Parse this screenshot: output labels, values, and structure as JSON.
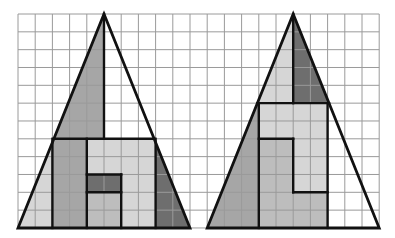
{
  "diagram": {
    "grid": {
      "origin_px": [
        18,
        14
      ],
      "cell_w_px": 17.2,
      "cell_h_px": 17.83,
      "cols": 21,
      "rows": 12,
      "line_color": "#9a9a9a",
      "background": "#ffffff"
    },
    "colors": {
      "outline": "#111111",
      "dark": "#6e6e6e",
      "medium": "#a6a6a6",
      "mediumlight": "#bdbdbd",
      "light": "#d6d6d6",
      "white": "#ffffff"
    },
    "figures": [
      {
        "name": "left-triangle",
        "outline": [
          [
            5,
            0
          ],
          [
            10,
            12
          ],
          [
            0,
            12
          ]
        ],
        "pieces": [
          {
            "name": "upper-left-piece",
            "fill": "medium",
            "poly": [
              [
                5,
                0
              ],
              [
                5,
                7
              ],
              [
                2.083,
                7
              ]
            ]
          },
          {
            "name": "upper-right-piece",
            "fill": "white",
            "poly": [
              [
                5,
                0
              ],
              [
                7.917,
                7
              ],
              [
                5,
                7
              ]
            ]
          },
          {
            "name": "left-edge-strip",
            "fill": "light",
            "poly": [
              [
                2.083,
                7
              ],
              [
                2,
                7
              ],
              [
                2,
                12
              ],
              [
                0,
                12
              ]
            ]
          },
          {
            "name": "left-column-piece",
            "fill": "medium",
            "poly": [
              [
                2,
                7
              ],
              [
                4,
                7
              ],
              [
                4,
                12
              ],
              [
                2,
                12
              ]
            ]
          },
          {
            "name": "top-light-piece",
            "fill": "light",
            "poly": [
              [
                4,
                7
              ],
              [
                8,
                7
              ],
              [
                8,
                12
              ],
              [
                6,
                12
              ],
              [
                6,
                9
              ],
              [
                4,
                9
              ]
            ]
          },
          {
            "name": "dark-block",
            "fill": "dark",
            "poly": [
              [
                4,
                9
              ],
              [
                6,
                9
              ],
              [
                6,
                10
              ],
              [
                4,
                10
              ]
            ]
          },
          {
            "name": "lower-middle-piece",
            "fill": "mediumlight",
            "poly": [
              [
                4,
                10
              ],
              [
                6,
                10
              ],
              [
                6,
                12
              ],
              [
                4,
                12
              ]
            ]
          },
          {
            "name": "right-edge-strip",
            "fill": "dark",
            "poly": [
              [
                7.917,
                7
              ],
              [
                8,
                7
              ],
              [
                8,
                12
              ],
              [
                10,
                12
              ]
            ]
          }
        ],
        "lines": [
          [
            [
              5,
              0
            ],
            [
              5,
              7
            ]
          ],
          [
            [
              2.083,
              7
            ],
            [
              7.917,
              7
            ]
          ],
          [
            [
              2,
              7
            ],
            [
              2,
              12
            ]
          ],
          [
            [
              8,
              7
            ],
            [
              8,
              12
            ]
          ],
          [
            [
              4,
              7
            ],
            [
              4,
              12
            ]
          ],
          [
            [
              4,
              9
            ],
            [
              6,
              9
            ]
          ],
          [
            [
              4,
              10
            ],
            [
              6,
              10
            ]
          ],
          [
            [
              6,
              9
            ],
            [
              6,
              12
            ]
          ]
        ]
      },
      {
        "name": "right-triangle",
        "outline": [
          [
            16,
            0
          ],
          [
            21,
            12
          ],
          [
            11,
            12
          ]
        ],
        "pieces": [
          {
            "name": "apex-left-piece",
            "fill": "light",
            "poly": [
              [
                16,
                0
              ],
              [
                16,
                5
              ],
              [
                13.917,
                5
              ]
            ]
          },
          {
            "name": "apex-right-piece",
            "fill": "dark",
            "poly": [
              [
                16,
                0
              ],
              [
                18.083,
                5
              ],
              [
                16,
                5
              ]
            ]
          },
          {
            "name": "left-side-piece",
            "fill": "medium",
            "poly": [
              [
                13.917,
                5
              ],
              [
                14,
                5
              ],
              [
                14,
                12
              ],
              [
                11,
                12
              ]
            ]
          },
          {
            "name": "upper-rect-piece",
            "fill": "light",
            "poly": [
              [
                14,
                5
              ],
              [
                18,
                5
              ],
              [
                18,
                10
              ],
              [
                16,
                10
              ],
              [
                16,
                7
              ],
              [
                14,
                7
              ]
            ]
          },
          {
            "name": "l-shape-piece",
            "fill": "mediumlight",
            "poly": [
              [
                14,
                7
              ],
              [
                16,
                7
              ],
              [
                16,
                10
              ],
              [
                18,
                10
              ],
              [
                18,
                12
              ],
              [
                14,
                12
              ]
            ]
          },
          {
            "name": "right-side-piece",
            "fill": "white",
            "poly": [
              [
                18.083,
                5
              ],
              [
                18,
                5
              ],
              [
                18,
                12
              ],
              [
                21,
                12
              ]
            ]
          }
        ],
        "lines": [
          [
            [
              16,
              0
            ],
            [
              16,
              5
            ]
          ],
          [
            [
              13.917,
              5
            ],
            [
              18.083,
              5
            ]
          ],
          [
            [
              14,
              5
            ],
            [
              14,
              12
            ]
          ],
          [
            [
              18,
              5
            ],
            [
              18,
              12
            ]
          ],
          [
            [
              14,
              7
            ],
            [
              16,
              7
            ]
          ],
          [
            [
              16,
              7
            ],
            [
              16,
              10
            ]
          ],
          [
            [
              16,
              10
            ],
            [
              18,
              10
            ]
          ]
        ]
      }
    ]
  }
}
